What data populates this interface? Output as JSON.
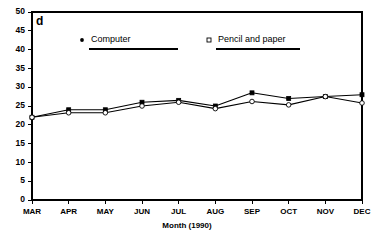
{
  "panel_letter": "d",
  "chart_data": {
    "type": "line",
    "title": "",
    "xlabel": "Month (1990)",
    "ylabel": "",
    "categories": [
      "MAR",
      "APR",
      "MAY",
      "JUN",
      "JUL",
      "AUG",
      "SEP",
      "OCT",
      "NOV",
      "DEC"
    ],
    "ylim": [
      0,
      50
    ],
    "ytick_step": 5,
    "yticks": [
      0,
      5,
      10,
      15,
      20,
      25,
      30,
      35,
      40,
      45,
      50
    ],
    "ytick_labels": [
      "0",
      "5",
      "10",
      "15",
      "20",
      "25",
      "30",
      "35",
      "40",
      "45",
      "50"
    ],
    "grid": false,
    "legend_position": "top-inside",
    "series": [
      {
        "name": "Computer",
        "marker": "filled-square",
        "values": [
          22.0,
          24.0,
          24.0,
          26.0,
          26.5,
          25.0,
          28.5,
          27.0,
          27.5,
          28.0
        ]
      },
      {
        "name": "Pencil and paper",
        "marker": "open-circle",
        "values": [
          22.0,
          23.2,
          23.2,
          25.0,
          26.0,
          24.3,
          26.2,
          25.3,
          27.5,
          25.8
        ]
      }
    ]
  },
  "legend": [
    {
      "label": "Computer",
      "marker": "filled-dot-icon"
    },
    {
      "label": "Pencil and paper",
      "marker": "open-square-icon"
    }
  ],
  "colors": {
    "axis": "#000000",
    "series": "#000000",
    "background": "#ffffff"
  }
}
